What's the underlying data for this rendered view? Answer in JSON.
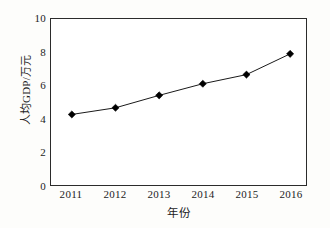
{
  "chart_data": {
    "type": "line",
    "title": "",
    "subtitle": "",
    "xlabel": "年份",
    "ylabel": "人均GDP/万元",
    "categories": [
      "2011",
      "2012",
      "2013",
      "2014",
      "2015",
      "2016"
    ],
    "x": [
      2011,
      2012,
      2013,
      2014,
      2015,
      2016
    ],
    "values": [
      4.25,
      4.65,
      5.4,
      6.1,
      6.65,
      7.9
    ],
    "series": [
      {
        "name": "人均GDP",
        "values": [
          4.25,
          4.65,
          5.4,
          6.1,
          6.65,
          7.9
        ]
      }
    ],
    "ylim": [
      0,
      10
    ],
    "yticks": [
      0,
      2,
      4,
      6,
      8,
      10
    ],
    "ytick_labels": [
      "0",
      "2",
      "4",
      "6",
      "8",
      "10"
    ],
    "xtick_labels": [
      "2011",
      "2012",
      "2013",
      "2014",
      "2015",
      "2016"
    ],
    "grid": false,
    "legend": false,
    "legend_position": "none",
    "marker": "diamond",
    "marker_color": "#000000",
    "line_color": "#1a1a1a",
    "axis_color": "#2b2b2b",
    "plot_background": "#ffffff",
    "figure_background": "#fdfdfb",
    "annotations": []
  }
}
